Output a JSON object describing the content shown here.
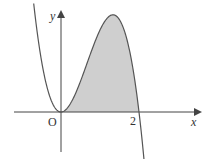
{
  "figure": {
    "function": "y = x^2(2 - x)",
    "x_range": [
      -0.7,
      2.2
    ],
    "shaded_region": {
      "from": 0,
      "to": 2,
      "description": "area between curve and x-axis"
    },
    "labels": {
      "origin": "O",
      "x_axis": "x",
      "y_axis": "y",
      "x_tick": "2"
    },
    "colors": {
      "curve": "#555555",
      "axis": "#444444",
      "fill": "#cfcfcf"
    }
  }
}
